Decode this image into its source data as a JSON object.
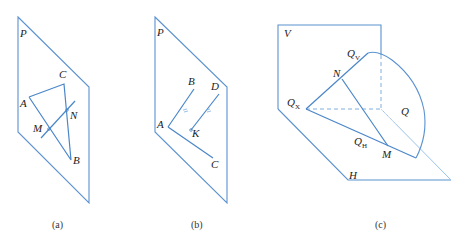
{
  "top_strip_text": "",
  "colors": {
    "line": "#4a86c8",
    "line_light": "#7fb0e0",
    "label": "#222222"
  },
  "figure_a": {
    "caption": "(a)",
    "plane_label": "P",
    "points": {
      "A": "A",
      "B": "B",
      "C": "C",
      "M": "M",
      "N": "N"
    }
  },
  "figure_b": {
    "caption": "(b)",
    "plane_label": "P",
    "points": {
      "A": "A",
      "B": "B",
      "C": "C",
      "D": "D",
      "K": "K"
    }
  },
  "figure_c": {
    "caption": "(c)",
    "labels": {
      "V": "V",
      "H": "H",
      "Q": "Q",
      "N": "N",
      "M": "M",
      "Q_main": "Q",
      "sub_V": "V",
      "sub_X": "X",
      "sub_H": "H"
    }
  }
}
